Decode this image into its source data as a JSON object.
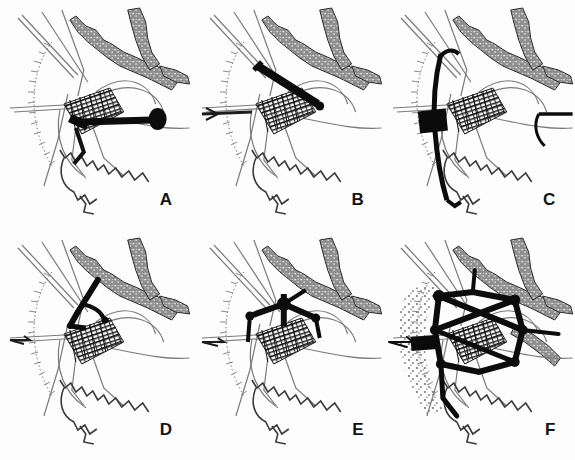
{
  "figure": {
    "layout": {
      "rows": 2,
      "cols": 3,
      "panel_width": 191.6,
      "panel_height": 230
    },
    "background_color": "#fdfdfd",
    "ink_color": "#1a1a1a",
    "midtone_color": "#6e6e6e",
    "light_color": "#9a9a9a"
  },
  "panels": [
    {
      "id": "A",
      "label": "A",
      "row": 0,
      "col": 0,
      "emphasis": "bold east-west axis road terminating in a solid round node east of the town core, plus blackened core blocks",
      "features": [
        "river-band",
        "hachure-escarpment",
        "historic-grid-core",
        "radial-roads",
        "serrated-wall",
        "bold-axis",
        "node-marker"
      ]
    },
    {
      "id": "B",
      "label": "B",
      "row": 0,
      "col": 1,
      "emphasis": "bold thick diagonal bar running north-east above the core, detached from the town centre",
      "features": [
        "river-band",
        "hachure-escarpment",
        "historic-grid-core",
        "radial-roads",
        "serrated-wall",
        "bold-diagonal-bar"
      ]
    },
    {
      "id": "C",
      "label": "C",
      "row": 0,
      "col": 2,
      "emphasis": "solid black rectangular block west of the core with a bold north-south spine road",
      "features": [
        "river-band",
        "hachure-escarpment",
        "historic-grid-core",
        "radial-roads",
        "serrated-wall",
        "black-block",
        "bold-spine-road"
      ]
    },
    {
      "id": "D",
      "label": "D",
      "row": 1,
      "col": 0,
      "emphasis": "bold hooked branch north of the core with a short bent spur",
      "features": [
        "river-band",
        "hachure-escarpment",
        "historic-grid-core",
        "radial-roads",
        "serrated-wall",
        "bold-hook-branch"
      ]
    },
    {
      "id": "E",
      "label": "E",
      "row": 1,
      "col": 1,
      "emphasis": "bold radiating star junction north of the core with three thick arms",
      "features": [
        "river-band",
        "hachure-escarpment",
        "historic-grid-core",
        "radial-roads",
        "serrated-wall",
        "bold-star-junction"
      ]
    },
    {
      "id": "F",
      "label": "F",
      "row": 1,
      "col": 2,
      "emphasis": "fully developed bold ring and radial network with multiple thick junction nodes and extended stippled fringe",
      "features": [
        "river-band",
        "hachure-escarpment",
        "historic-grid-core",
        "radial-roads",
        "serrated-wall",
        "bold-ring-network",
        "junction-nodes",
        "stippled-fringe"
      ]
    }
  ],
  "legend_keys": {
    "river_band": "stippled double-edged band (river / valley floor)",
    "hachure": "hachured arc (escarpment / slope)",
    "grid_core": "dense cross-hatched grid (historic town core)",
    "wall": "serrated line (town wall / boundary)",
    "bold_line": "solid black line (emphasised new structure)"
  }
}
